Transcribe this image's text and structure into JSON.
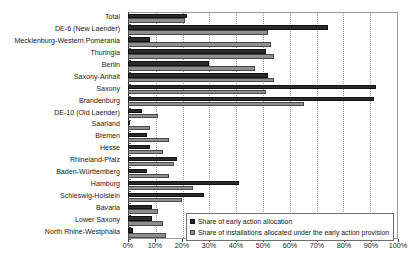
{
  "chart_data": {
    "type": "bar",
    "orientation": "horizontal",
    "title": "",
    "xlabel": "",
    "ylabel": "",
    "xlim": [
      0,
      100
    ],
    "xtick_labels": [
      "0%",
      "10%",
      "20%",
      "30%",
      "40%",
      "50%",
      "60%",
      "70%",
      "80%",
      "90%",
      "100%"
    ],
    "xtick_values": [
      0,
      10,
      20,
      30,
      40,
      50,
      60,
      70,
      80,
      90,
      100
    ],
    "grid": true,
    "grid_axis": "x",
    "legend_position": "bottom-right",
    "categories": [
      "Total",
      "DE-6 (New Laender)",
      "Mecklenburg-Western Pomerania",
      "Thuringia",
      "Berlin",
      "Saxony-Anhalt",
      "Saxony",
      "Brandenburg",
      "DE-10 (Old Laender)",
      "Saarland",
      "Bremen",
      "Hesse",
      "Rhineland-Pfalz",
      "Baden-Württemberg",
      "Hamburg",
      "Schleswig-Holstein",
      "Bavaria",
      "Lower Saxony",
      "North Rhine-Westphalia"
    ],
    "series": [
      {
        "name": "Share of early action allocation",
        "color": "#2a2a2a",
        "values": [
          22,
          74,
          8,
          51,
          30,
          52,
          92,
          91,
          5,
          0.4,
          7,
          8,
          18,
          7,
          41,
          28,
          9,
          9,
          2
        ]
      },
      {
        "name": "Share of installations allocated under the early action provision",
        "color": "#8e8e8e",
        "values": [
          21,
          52,
          53,
          54,
          47,
          54,
          51,
          65,
          11,
          8,
          15,
          13,
          17,
          15,
          24,
          20,
          11,
          13,
          14
        ]
      }
    ]
  },
  "legend": {
    "items": [
      {
        "label": "Share of early action allocation",
        "swatch": "dark"
      },
      {
        "label": "Share of installations allocated under the early action provision",
        "swatch": "light"
      }
    ]
  },
  "caption": {
    "text": ""
  }
}
